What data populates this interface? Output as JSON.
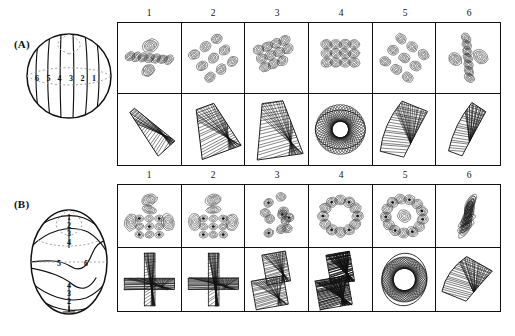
{
  "figure": {
    "type": "scientific-figure",
    "panels": [
      {
        "id": "A",
        "label": "(A)",
        "sphere": {
          "type": "meridian-lines",
          "description": "sphere with six near-vertical meridian curves",
          "line_labels": [
            "6",
            "5",
            "4",
            "3",
            "2",
            "1"
          ],
          "has_equator_dashed": true
        },
        "column_headers": [
          "1",
          "2",
          "3",
          "4",
          "5",
          "6"
        ],
        "rows": [
          {
            "name": "quantum-contours",
            "kind": "contour",
            "cells": [
              {
                "label": "1",
                "motif": "diagonal-lobe-chain-steep",
                "lobes": 7,
                "tilt": -40
              },
              {
                "label": "2",
                "motif": "diagonal-lobe-cluster",
                "lobes": 9,
                "tilt": -35
              },
              {
                "label": "3",
                "motif": "compact-lobe-cluster",
                "lobes": 11,
                "tilt": -20
              },
              {
                "label": "4",
                "motif": "round-lobe-cluster",
                "lobes": 12,
                "tilt": 0
              },
              {
                "label": "5",
                "motif": "diagonal-lobe-cluster-mirror",
                "lobes": 9,
                "tilt": 35
              },
              {
                "label": "6",
                "motif": "diagonal-lobe-chain-steep-mirror",
                "lobes": 7,
                "tilt": 40
              }
            ]
          },
          {
            "name": "classical-trajectories",
            "kind": "mesh",
            "cells": [
              {
                "label": "1",
                "motif": "narrow-wedge",
                "tilt": -42,
                "w": 0.36,
                "h": 0.82
              },
              {
                "label": "2",
                "motif": "broad-wedge",
                "tilt": -20,
                "w": 0.66,
                "h": 0.78
              },
              {
                "label": "3",
                "motif": "triangular-fan",
                "tilt": -8,
                "w": 0.74,
                "h": 0.88
              },
              {
                "label": "4",
                "motif": "open-loop-rosette",
                "tilt": 0,
                "w": 0.8,
                "h": 0.62
              },
              {
                "label": "5",
                "motif": "curved-band-broad",
                "tilt": 14,
                "w": 0.58,
                "h": 0.86
              },
              {
                "label": "6",
                "motif": "curved-band-narrow",
                "tilt": 20,
                "w": 0.34,
                "h": 0.84
              }
            ]
          }
        ]
      },
      {
        "id": "B",
        "label": "(B)",
        "sphere": {
          "type": "spiral-winding-lines",
          "description": "sphere with S-shaped winding curves crossing the equator",
          "line_labels_top": [
            "1",
            "2",
            "3",
            "4"
          ],
          "line_labels_middle": [
            "5",
            "6"
          ],
          "line_labels_bottom": [
            "4",
            "3",
            "2",
            "1"
          ],
          "has_equator_dashed": true
        },
        "column_headers": [
          "1",
          "2",
          "3",
          "4",
          "5",
          "6"
        ],
        "rows": [
          {
            "name": "quantum-contours",
            "kind": "contour",
            "cells": [
              {
                "label": "1",
                "motif": "cross-lobed-cluster",
                "lobes": 13,
                "tilt": 0
              },
              {
                "label": "2",
                "motif": "cross-lobed-cluster",
                "lobes": 13,
                "tilt": 0
              },
              {
                "label": "3",
                "motif": "scattered-ring-cluster",
                "lobes": 11,
                "tilt": -15
              },
              {
                "label": "4",
                "motif": "annular-rosette",
                "lobes": 12,
                "tilt": 0
              },
              {
                "label": "5",
                "motif": "dense-rosette",
                "lobes": 13,
                "tilt": 10
              },
              {
                "label": "6",
                "motif": "diagonal-stripe-cluster",
                "lobes": 10,
                "tilt": 38
              }
            ]
          },
          {
            "name": "classical-trajectories",
            "kind": "mesh",
            "cells": [
              {
                "label": "1",
                "motif": "cross-bands",
                "tilt": 0,
                "w": 0.8,
                "h": 0.88
              },
              {
                "label": "2",
                "motif": "cross-bands",
                "tilt": 0,
                "w": 0.8,
                "h": 0.88
              },
              {
                "label": "3",
                "motif": "offset-block-pair",
                "tilt": -10,
                "w": 0.8,
                "h": 0.86
              },
              {
                "label": "4",
                "motif": "filled-block-pair",
                "tilt": -10,
                "w": 0.84,
                "h": 0.86
              },
              {
                "label": "5",
                "motif": "woven-oval",
                "tilt": 8,
                "w": 0.72,
                "h": 0.84
              },
              {
                "label": "6",
                "motif": "crescent-band",
                "tilt": 22,
                "w": 0.62,
                "h": 0.66
              }
            ]
          }
        ]
      }
    ]
  },
  "colors": {
    "ink": "#111111",
    "paper": "#ffffff",
    "dashed": "#9a9a9a"
  }
}
